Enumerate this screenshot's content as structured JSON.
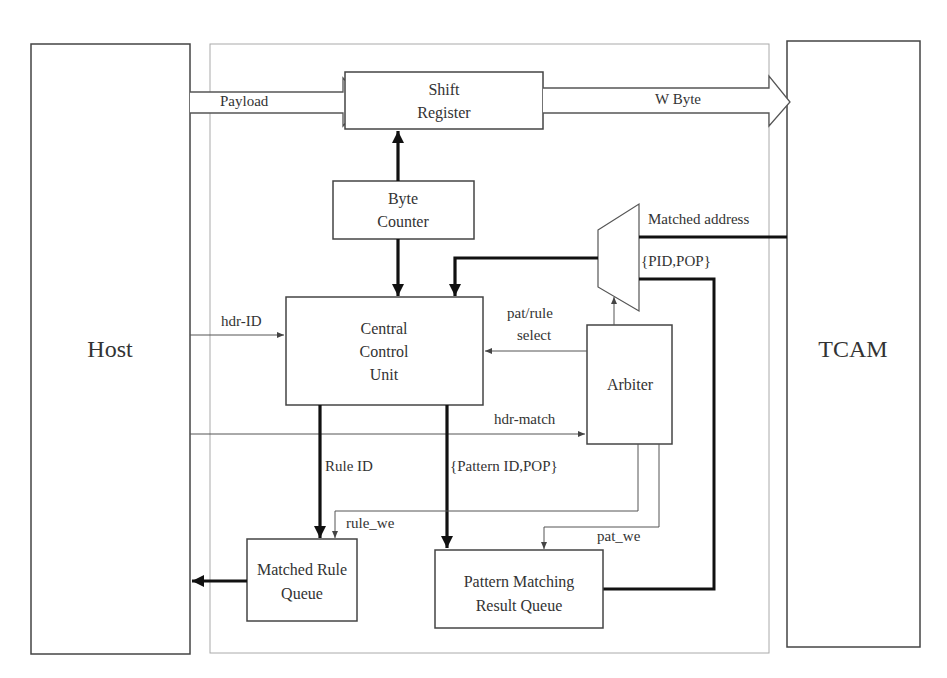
{
  "diagram": {
    "colors": {
      "stroke": "#444444",
      "light_stroke": "#888888",
      "thick_stroke": "#111111",
      "text": "#333333",
      "background": "#ffffff"
    },
    "external_blocks": {
      "host": {
        "label": "Host"
      },
      "tcam": {
        "label": "TCAM"
      }
    },
    "blocks": {
      "shift_register": {
        "line1": "Shift",
        "line2": "Register"
      },
      "byte_counter": {
        "line1": "Byte",
        "line2": "Counter"
      },
      "central_control_unit": {
        "line1": "Central",
        "line2": "Control",
        "line3": "Unit"
      },
      "arbiter": {
        "label": "Arbiter"
      },
      "matched_rule_queue": {
        "line1": "Matched Rule",
        "line2": "Queue"
      },
      "pattern_matching_result_queue": {
        "line1": "Pattern Matching",
        "line2": "Result Queue"
      },
      "mux": {
        "label": ""
      }
    },
    "signals": {
      "payload": "Payload",
      "w_byte": "W Byte",
      "matched_address": "Matched address",
      "pid_pop": "{PID,POP}",
      "hdr_id": "hdr-ID",
      "pat_rule_select_1": "pat/rule",
      "pat_rule_select_2": "select",
      "hdr_match": "hdr-match",
      "rule_id": "Rule ID",
      "pattern_id_pop": "{Pattern ID,POP}",
      "rule_we": "rule_we",
      "pat_we": "pat_we"
    }
  }
}
